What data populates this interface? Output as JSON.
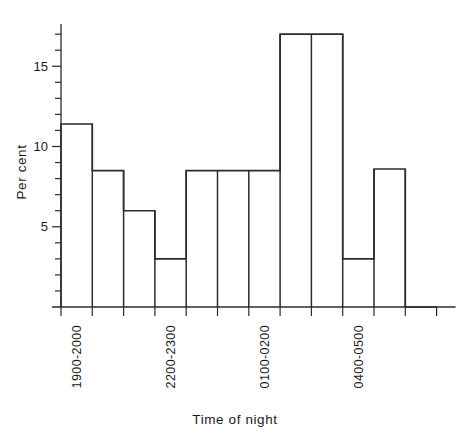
{
  "chart_data": {
    "type": "bar",
    "title": "",
    "subtitle": "",
    "xlabel": "Time of night",
    "ylabel": "Per cent",
    "categories": [
      "1900-2000",
      "2000-2100",
      "2100-2200",
      "2200-2300",
      "2300-0000",
      "0000-0100",
      "0100-0200",
      "0200-0300",
      "0300-0400",
      "0400-0500",
      "0500-0600",
      "0600-0700"
    ],
    "values": [
      11.4,
      8.5,
      6.0,
      3.0,
      8.5,
      8.5,
      8.5,
      17.0,
      17.0,
      3.0,
      8.6,
      0.0
    ],
    "ylim": [
      0,
      18
    ],
    "xlim": [
      0,
      12
    ],
    "y_major_ticks": [
      5,
      10,
      15
    ],
    "y_major_tick_labels": [
      "5",
      "10",
      "15"
    ],
    "y_minor_tick_step": 1,
    "grid": false,
    "legend": null,
    "legend_position": "none",
    "visible_category_labels": [
      {
        "index": 0,
        "text": "1900-2000"
      },
      {
        "index": 3,
        "text": "2200-2300"
      },
      {
        "index": 6,
        "text": "0100-0200"
      },
      {
        "index": 9,
        "text": "0400-0500"
      }
    ],
    "colors": {
      "axis": "#2b2b2b",
      "bar_stroke": "#2b2b2b",
      "bar_fill": "none",
      "background": "#ffffff",
      "text": "#1a1a1a"
    }
  }
}
